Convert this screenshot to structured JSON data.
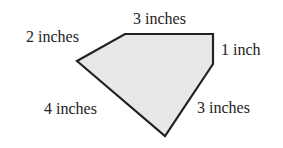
{
  "diagram": {
    "shape": "pentagon",
    "fill": "#e8e8e8",
    "stroke": "#222222",
    "vertices": [
      [
        77,
        61
      ],
      [
        125,
        34
      ],
      [
        213,
        34
      ],
      [
        213,
        64
      ],
      [
        165,
        136
      ]
    ],
    "labels": {
      "top": "3 inches",
      "upper_left": "2 inches",
      "right": "1 inch",
      "lower_left": "4 inches",
      "lower_right": "3 inches"
    }
  }
}
